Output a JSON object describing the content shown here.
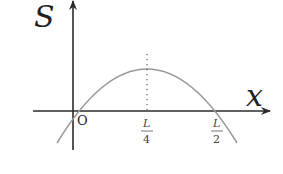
{
  "diagram": {
    "type": "function-graph",
    "axes": {
      "y_label": "S",
      "x_label": "x",
      "origin_label": "O"
    },
    "tick_labels": [
      {
        "numerator": "L",
        "denominator": "4",
        "position": "L/4"
      },
      {
        "numerator": "L",
        "denominator": "2",
        "position": "L/2"
      }
    ],
    "curve": {
      "shape": "parabola",
      "opens": "down",
      "roots": [
        "0",
        "L/2"
      ],
      "vertex_x": "L/4",
      "color": "#9a9a9a"
    },
    "vertex_guide": {
      "style": "dotted",
      "from": "vertex",
      "to": "x-axis"
    },
    "colors": {
      "axis": "#2b2b2b",
      "curve": "#9a9a9a",
      "text": "#222222"
    }
  }
}
